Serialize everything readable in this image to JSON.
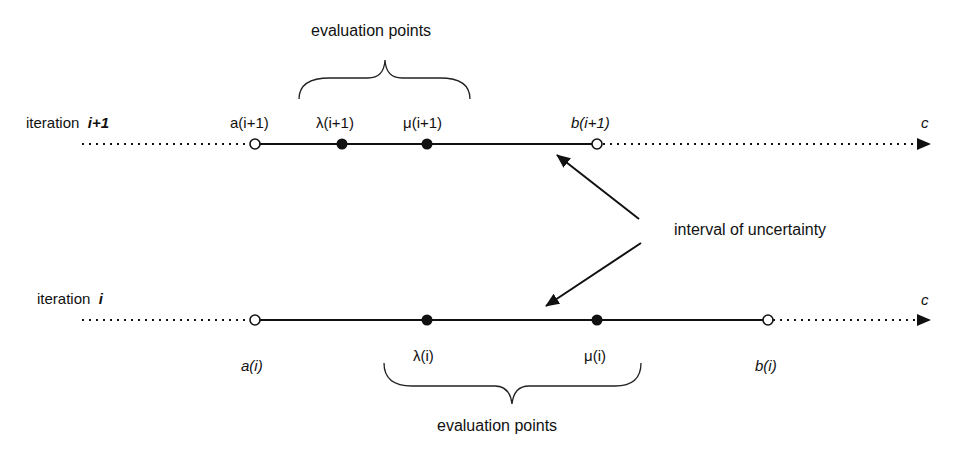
{
  "diagram": {
    "top_row": {
      "label": "iteration",
      "index": "i+1",
      "points": [
        {
          "name": "a",
          "arg": "(i+1)",
          "x": 255,
          "type": "open"
        },
        {
          "name": "λ",
          "arg": "(i+1)",
          "x": 342,
          "type": "filled"
        },
        {
          "name": "μ",
          "arg": "(i+1)",
          "x": 427,
          "type": "filled"
        },
        {
          "name": "b",
          "arg": "(i+1)",
          "x": 597,
          "type": "open"
        }
      ],
      "axis_label": "c",
      "brace_label": "evaluation points"
    },
    "bottom_row": {
      "label": "iteration",
      "index": "i",
      "points": [
        {
          "name": "a",
          "arg": "(i)",
          "x": 255,
          "type": "open"
        },
        {
          "name": "λ",
          "arg": "(i)",
          "x": 427,
          "type": "filled"
        },
        {
          "name": "μ",
          "arg": "(i)",
          "x": 597,
          "type": "filled"
        },
        {
          "name": "b",
          "arg": "(i)",
          "x": 768,
          "type": "open"
        }
      ],
      "axis_label": "c",
      "brace_label": "evaluation points"
    },
    "annotation": "interval of uncertainty"
  },
  "labels": {
    "top_iter_word": "iteration",
    "top_iter_idx": "i+1",
    "top_a": "a(i+1)",
    "top_lambda": "λ(i+1)",
    "top_mu": "μ(i+1)",
    "top_b": "b(i+1)",
    "top_c": "c",
    "top_brace": "evaluation points",
    "bot_iter_word": "iteration",
    "bot_iter_idx": "i",
    "bot_a": "a(i)",
    "bot_lambda": "λ(i)",
    "bot_mu": "μ(i)",
    "bot_b": "b(i)",
    "bot_c": "c",
    "bot_brace": "evaluation points",
    "annotation": "interval of uncertainty"
  }
}
